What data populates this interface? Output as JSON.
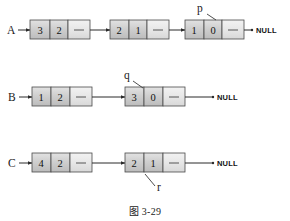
{
  "figure": {
    "caption": "图 3-29",
    "colors": {
      "background": "#ffffff",
      "cell_data_fill": "#d0d0d0",
      "cell_ptr_fill": "#e6e6e6",
      "cell_border": "#4a4a4a",
      "line": "#2a2a2a",
      "text": "#111111"
    },
    "null_label": "NULL"
  },
  "lists": [
    {
      "name": "A",
      "label": "A",
      "y": 30,
      "null_x": 252,
      "nodes": [
        {
          "x": 30,
          "cells": [
            "3",
            "2",
            ""
          ],
          "pointer_label": null
        },
        {
          "x": 110,
          "cells": [
            "2",
            "1",
            ""
          ],
          "pointer_label": null
        },
        {
          "x": 185,
          "cells": [
            "1",
            "0",
            ""
          ],
          "pointer_label": "p",
          "label_x": 197,
          "label_y": 12,
          "leader": "207,14 216,20"
        }
      ]
    },
    {
      "name": "B",
      "label": "B",
      "y": 97,
      "null_x": 213,
      "nodes": [
        {
          "x": 32,
          "cells": [
            "1",
            "2",
            ""
          ],
          "pointer_label": null
        },
        {
          "x": 125,
          "cells": [
            "3",
            "0",
            ""
          ],
          "pointer_label": "q",
          "label_x": 124,
          "label_y": 79,
          "leader": "133,81 143,88"
        }
      ]
    },
    {
      "name": "C",
      "label": "C",
      "y": 163,
      "null_x": 213,
      "nodes": [
        {
          "x": 32,
          "cells": [
            "4",
            "2",
            ""
          ],
          "pointer_label": null
        },
        {
          "x": 125,
          "cells": [
            "2",
            "1",
            ""
          ],
          "pointer_label": "r",
          "label_x": 157,
          "label_y": 191,
          "leader": "145,175 155,186"
        }
      ]
    }
  ]
}
